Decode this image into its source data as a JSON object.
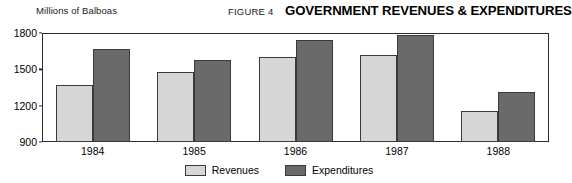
{
  "header": {
    "unit_label": "Millions of Balboas",
    "figure_number": "FIGURE 4",
    "title": "GOVERNMENT REVENUES & EXPENDITURES"
  },
  "legend": {
    "items": [
      {
        "label": "Revenues",
        "swatch": "revenues",
        "color": "#d6d6d6"
      },
      {
        "label": "Expenditures",
        "swatch": "expenditures",
        "color": "#6a6a6a"
      }
    ]
  },
  "chart_data": {
    "type": "bar",
    "title": "GOVERNMENT REVENUES & EXPENDITURES",
    "subtitle": "FIGURE 4",
    "xlabel": "",
    "ylabel": "Millions of Balboas",
    "categories": [
      "1984",
      "1985",
      "1986",
      "1987",
      "1988"
    ],
    "series": [
      {
        "name": "Revenues",
        "color": "#d6d6d6",
        "values": [
          1370,
          1475,
          1600,
          1615,
          1160
        ]
      },
      {
        "name": "Expenditures",
        "color": "#6a6a6a",
        "values": [
          1670,
          1575,
          1740,
          1780,
          1310
        ]
      }
    ],
    "ylim": [
      900,
      1800
    ],
    "yticks": [
      900,
      1200,
      1500,
      1800
    ],
    "grid": false,
    "legend_position": "bottom-center"
  }
}
